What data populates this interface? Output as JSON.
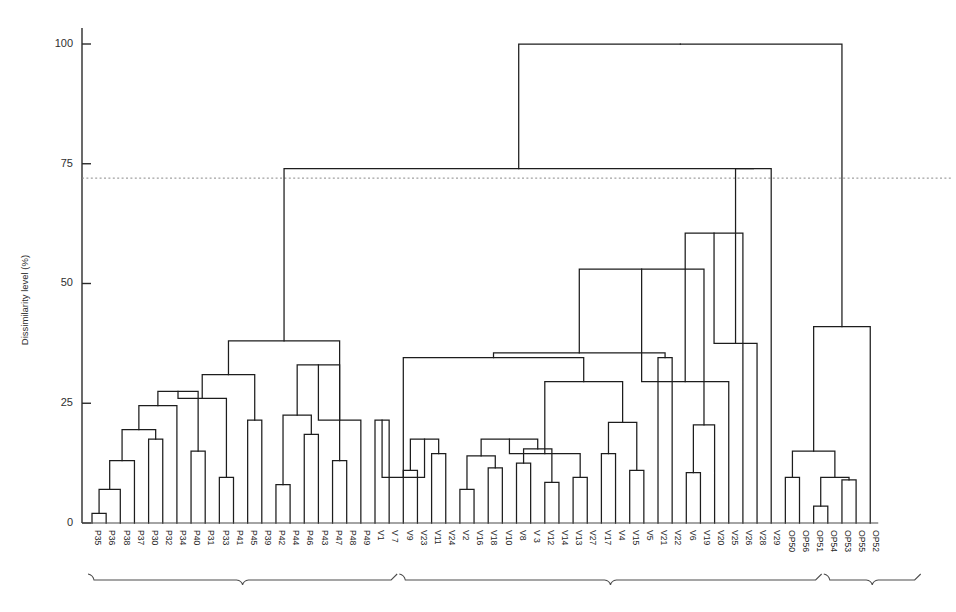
{
  "figure": {
    "title": "",
    "background": "#ffffff",
    "line_color": "#1d1d1d",
    "threshold_color": "#8a8a8a"
  },
  "axis": {
    "y_title": "Dissimilarity level (%)",
    "y_ticks": [
      0,
      25,
      50,
      75,
      100
    ],
    "y_tick_labels": [
      "0",
      "25",
      "50",
      "75",
      "100"
    ],
    "y_min": 0,
    "y_max": 105
  },
  "annotations": {
    "threshold_value": 72,
    "group_braces": [
      {
        "name": "brace-group-p",
        "from_leaf": 0,
        "to_leaf": 21,
        "label": ""
      },
      {
        "name": "brace-group-v",
        "from_leaf": 22,
        "to_leaf": 51,
        "label": ""
      },
      {
        "name": "brace-group-op",
        "from_leaf": 52,
        "to_leaf": 58,
        "label": ""
      }
    ]
  },
  "chart_data": {
    "type": "dendrogram",
    "title": "",
    "xlabel": "",
    "ylabel": "Dissimilarity level (%)",
    "ylim": [
      0,
      105
    ],
    "grid": false,
    "legend": "none",
    "leaves": [
      "P35",
      "P36",
      "P38",
      "P37",
      "P30",
      "P32",
      "P34",
      "P40",
      "P31",
      "P33",
      "P41",
      "P45",
      "P39",
      "P42",
      "P44",
      "P46",
      "P43",
      "P47",
      "P48",
      "P49",
      "V1",
      "V 7",
      "V9",
      "V23",
      "V11",
      "V24",
      "V2",
      "V16",
      "V18",
      "V10",
      "V8",
      "V 3",
      "V12",
      "V14",
      "V13",
      "V27",
      "V17",
      "V4",
      "V15",
      "V5",
      "V21",
      "V22",
      "V6",
      "V19",
      "V20",
      "V25",
      "V26",
      "V28",
      "V29",
      "OP50",
      "OP56",
      "OP51",
      "OP54",
      "OP53",
      "OP55",
      "OP52"
    ],
    "merges": [
      {
        "id": "m1",
        "left": "P35",
        "right": "P36",
        "height": 2
      },
      {
        "id": "m2",
        "left": "m1",
        "right": "P38",
        "height": 7
      },
      {
        "id": "m3",
        "left": "m2",
        "right": "P37",
        "height": 13
      },
      {
        "id": "m4",
        "left": "P30",
        "right": "P32",
        "height": 17.5
      },
      {
        "id": "m5",
        "left": "m3",
        "right": "m4",
        "height": 19.5
      },
      {
        "id": "m6",
        "left": "m5",
        "right": "P34",
        "height": 24.5
      },
      {
        "id": "m7",
        "left": "P40",
        "right": "P31",
        "height": 15
      },
      {
        "id": "m8",
        "left": "m6",
        "right": "m7",
        "height": 27.5
      },
      {
        "id": "m9",
        "left": "P33",
        "right": "P41",
        "height": 9.5
      },
      {
        "id": "m10",
        "left": "m8",
        "right": "m9",
        "height": 26
      },
      {
        "id": "m11",
        "left": "P45",
        "right": "P39",
        "height": 21.5
      },
      {
        "id": "m12",
        "left": "m10",
        "right": "m11",
        "height": 31
      },
      {
        "id": "m13",
        "left": "P42",
        "right": "P44",
        "height": 8
      },
      {
        "id": "m14",
        "left": "P46",
        "right": "P43",
        "height": 18.5
      },
      {
        "id": "m15",
        "left": "m13",
        "right": "m14",
        "height": 22.5
      },
      {
        "id": "m16",
        "left": "P47",
        "right": "P48",
        "height": 13
      },
      {
        "id": "m17",
        "left": "m15",
        "right": "m16",
        "height": 33
      },
      {
        "id": "m18",
        "left": "m17",
        "right": "P49",
        "height": 21.5
      },
      {
        "id": "m19",
        "left": "m12",
        "right": "m18",
        "height": 38
      },
      {
        "id": "n1",
        "left": "V1",
        "right": "V 7",
        "height": 21.5
      },
      {
        "id": "n2",
        "left": "V9",
        "right": "V23",
        "height": 11
      },
      {
        "id": "n3",
        "left": "V11",
        "right": "V24",
        "height": 14.5
      },
      {
        "id": "n4",
        "left": "n2",
        "right": "n3",
        "height": 17.5
      },
      {
        "id": "n5",
        "left": "n1",
        "right": "n4",
        "height": 9.5
      },
      {
        "id": "n6",
        "left": "V2",
        "right": "V16",
        "height": 7
      },
      {
        "id": "n7",
        "left": "V18",
        "right": "V10",
        "height": 11.5
      },
      {
        "id": "n8",
        "left": "n6",
        "right": "n7",
        "height": 14
      },
      {
        "id": "n9",
        "left": "V8",
        "right": "V 3",
        "height": 12.5
      },
      {
        "id": "n10",
        "left": "V12",
        "right": "V14",
        "height": 8.5
      },
      {
        "id": "n11",
        "left": "n9",
        "right": "n10",
        "height": 15.5
      },
      {
        "id": "n12",
        "left": "n8",
        "right": "n11",
        "height": 17.5
      },
      {
        "id": "n13",
        "left": "V13",
        "right": "V27",
        "height": 9.5
      },
      {
        "id": "n14",
        "left": "n12",
        "right": "n13",
        "height": 14.5
      },
      {
        "id": "n15",
        "left": "V17",
        "right": "V4",
        "height": 14.5
      },
      {
        "id": "n16",
        "left": "V15",
        "right": "V5",
        "height": 11
      },
      {
        "id": "n17",
        "left": "n15",
        "right": "n16",
        "height": 21
      },
      {
        "id": "n18",
        "left": "n14",
        "right": "n17",
        "height": 29.5
      },
      {
        "id": "n19",
        "left": "n5",
        "right": "n18",
        "height": 34.5
      },
      {
        "id": "n20",
        "left": "V21",
        "right": "V22",
        "height": 34.5
      },
      {
        "id": "n21",
        "left": "n19",
        "right": "n20",
        "height": 35.5
      },
      {
        "id": "n22",
        "left": "V6",
        "right": "V19",
        "height": 10.5
      },
      {
        "id": "n23",
        "left": "n22",
        "right": "V20",
        "height": 20.5
      },
      {
        "id": "n24",
        "left": "n21",
        "right": "n23",
        "height": 53
      },
      {
        "id": "n25",
        "left": "n24",
        "right": "V25",
        "height": 29.5
      },
      {
        "id": "n26",
        "left": "n25",
        "right": "V26",
        "height": 60.5
      },
      {
        "id": "n27",
        "left": "n26",
        "right": "V28",
        "height": 37.5
      },
      {
        "id": "n28",
        "left": "n27",
        "right": "V29",
        "height": 74
      },
      {
        "id": "o1",
        "left": "OP50",
        "right": "OP56",
        "height": 9.5
      },
      {
        "id": "o2",
        "left": "OP51",
        "right": "OP54",
        "height": 3.5
      },
      {
        "id": "o3",
        "left": "OP53",
        "right": "OP55",
        "height": 9
      },
      {
        "id": "o4",
        "left": "o2",
        "right": "o3",
        "height": 9.5
      },
      {
        "id": "o5",
        "left": "o1",
        "right": "o4",
        "height": 15
      },
      {
        "id": "o6",
        "left": "o5",
        "right": "OP52",
        "height": 41
      },
      {
        "id": "root_left",
        "left": "m19",
        "right": "n28",
        "height": 74
      },
      {
        "id": "root",
        "left": "root_left",
        "right": "o6",
        "height": 100
      }
    ]
  }
}
